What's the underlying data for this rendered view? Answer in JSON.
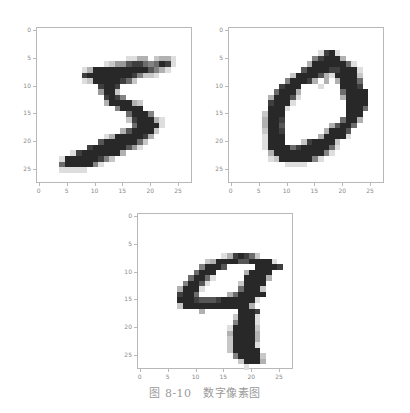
{
  "caption": "图 8-10　数字像素图",
  "chart_data": [
    {
      "type": "heatmap",
      "title": "",
      "label": "5",
      "colormap": "gray_r",
      "xlabel": "",
      "ylabel": "",
      "xlim": [
        -0.5,
        27.5
      ],
      "ylim": [
        27.5,
        -0.5
      ],
      "xticks": [
        0,
        5,
        10,
        15,
        20,
        25
      ],
      "yticks": [
        0,
        5,
        10,
        15,
        20,
        25
      ],
      "grid": false,
      "rows": [
        "............................",
        "............................",
        "............................",
        "............................",
        "............................",
        "................1133.2331...",
        "............1244788656981...",
        "........1399999999997531....",
        "........89999999985221......",
        "........1299999862..........",
        "...........8998.............",
        "...........4992.............",
        "............8985............",
        "............3999932.........",
        "..............59999.........",
        "................69995.......",
        "................2899931.....",
        ".................699991.....",
        "...............3799992......",
        "............139999983.......",
        "...........799999962........",
        ".........8999999741.........",
        "......1899999993............",
        "....1999999852..............",
        "....69999951................",
        "....11111...................",
        "............................",
        "............................"
      ]
    },
    {
      "type": "heatmap",
      "title": "",
      "label": "0",
      "colormap": "gray_r",
      "xlabel": "",
      "ylabel": "",
      "xlim": [
        -0.5,
        27.5
      ],
      "ylim": [
        27.5,
        -0.5
      ],
      "xticks": [
        0,
        5,
        10,
        15,
        20,
        25
      ],
      "yticks": [
        0,
        5,
        10,
        15,
        20,
        25
      ],
      "grid": false,
      "rows": [
        "............................",
        "............................",
        "............................",
        "............................",
        "................1891........",
        "...............589993.......",
        "..............399999961.....",
        ".............79999889991....",
        "...........2999973199992....",
        "..........599983.3.39996....",
        ".........8999...1...9998....",
        "........69993.......69999...",
        ".......399971.......39999...",
        ".......89991.........9999...",
        ".......9991..........9996....",
        "......2999...........999....",
        "......3998..........6993....",
        "......3997........37996.....",
        "......2998.......39997......",
        "......1999......399991......",
        "......1999...2899992........",
        "......19999689999961........",
        ".......399999999951.........",
        ".......1299999951...........",
        "..........1111..............",
        "............................",
        "............................",
        "............................"
      ]
    },
    {
      "type": "heatmap",
      "title": "",
      "label": "9",
      "colormap": "gray_r",
      "xlabel": "",
      "ylabel": "",
      "xlim": [
        -0.5,
        27.5
      ],
      "ylim": [
        27.5,
        -0.5
      ],
      "xticks": [
        0,
        5,
        10,
        15,
        20,
        25
      ],
      "yticks": [
        0,
        5,
        10,
        15,
        20,
        25
      ],
      "grid": false,
      "rows": [
        "............................",
        "............................",
        "............................",
        "............................",
        "............................",
        "............................",
        "............................",
        "...............1389862......",
        "............2399997799991...",
        "...........59997.....99998..",
        "..........6999.....39999....",
        ".........69961.....99993....",
        "........59971.....29999.....",
        ".......39991......69992.....",
        ".......8996.....3699999.....",
        ".......999877789999991......",
        ".......29999999999993.......",
        "...........3......9998......",
        ".................29991......",
        ".................59991......",
        "................199992......",
        "................399993......",
        "................299993......",
        "................299991......",
        "................299999......",
        ".................599992.....",
        "..................29993.....",
        "...................1........"
      ]
    }
  ],
  "ticks": {
    "x": [
      "0",
      "5",
      "10",
      "15",
      "20",
      "25"
    ],
    "y": [
      "0",
      "5",
      "10",
      "15",
      "20",
      "25"
    ]
  }
}
